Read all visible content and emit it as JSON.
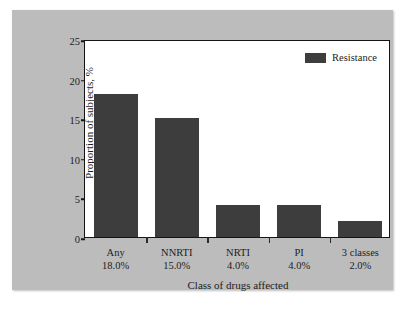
{
  "chart_data": {
    "type": "bar",
    "title": "",
    "categories": [
      "Any",
      "NNRTI",
      "NRTI",
      "PI",
      "3 classes"
    ],
    "category_values_text": [
      "18.0%",
      "15.0%",
      "4.0%",
      "4.0%",
      "2.0%"
    ],
    "values": [
      18.0,
      15.0,
      4.0,
      4.0,
      2.0
    ],
    "series": [
      {
        "name": "Resistance",
        "values": [
          18.0,
          15.0,
          4.0,
          4.0,
          2.0
        ],
        "color": "#3d3d3d"
      }
    ],
    "xlabel": "Class of drugs affected",
    "ylabel": "Proportion of subjects, %",
    "ylim": [
      0,
      25
    ],
    "yticks": [
      0,
      5,
      10,
      15,
      20,
      25
    ],
    "ytick_labels": [
      "0",
      "5",
      "10",
      "15",
      "20",
      "25"
    ],
    "grid": false,
    "legend": {
      "position": "top-right-inside",
      "entries": [
        "Resistance"
      ]
    }
  },
  "legend": {
    "label": "Resistance"
  },
  "axes": {
    "y_title": "Proportion of subjects, %",
    "x_title": "Class of drugs affected"
  },
  "colors": {
    "bar": "#3d3d3d",
    "panel_background": "#bcbcbc",
    "plot_background": "#ffffff",
    "axis": "#141414",
    "text": "#1c1c1c"
  }
}
